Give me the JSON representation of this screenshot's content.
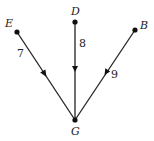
{
  "diagram": {
    "type": "directed-graph",
    "nodes": [
      {
        "id": "E",
        "label": "E",
        "x": 17,
        "y": 32
      },
      {
        "id": "D",
        "label": "D",
        "x": 75,
        "y": 22
      },
      {
        "id": "B",
        "label": "B",
        "x": 135,
        "y": 30
      },
      {
        "id": "G",
        "label": "G",
        "x": 75,
        "y": 120
      }
    ],
    "edges": [
      {
        "from": "E",
        "to": "G",
        "weight": "7"
      },
      {
        "from": "D",
        "to": "G",
        "weight": "8"
      },
      {
        "from": "B",
        "to": "G",
        "weight": "9"
      }
    ]
  }
}
